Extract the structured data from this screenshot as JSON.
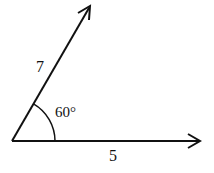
{
  "diagram": {
    "type": "angle-between-vectors",
    "vertex": {
      "x": 12,
      "y": 141
    },
    "vectors": [
      {
        "name": "slanted-vector",
        "label": "7",
        "end": {
          "x": 90,
          "y": 7
        }
      },
      {
        "name": "horizontal-vector",
        "label": "5",
        "end": {
          "x": 200,
          "y": 141
        }
      }
    ],
    "angle": {
      "label": "60°",
      "degrees": 60
    },
    "colors": {
      "stroke": "#111111",
      "background": "#ffffff"
    }
  },
  "labels": {
    "side_slanted": "7",
    "side_horizontal": "5",
    "angle": "60°"
  }
}
